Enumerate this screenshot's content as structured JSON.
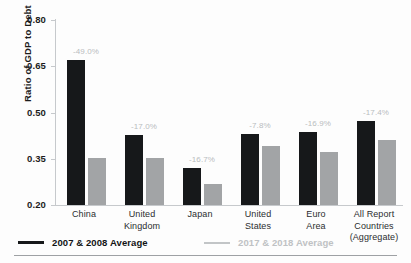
{
  "figure": {
    "top_caption": "",
    "background": "#fdfdfd"
  },
  "colors": {
    "series_old": "#16181a",
    "series_new": "#a2a4a6",
    "annotation": "#b9bcbe",
    "axis": "#c6c9cc",
    "text": "#1c1c1c"
  },
  "chart_data": {
    "type": "bar",
    "title": "",
    "xlabel": "",
    "ylabel": "Ratio of GDP to Debt",
    "ylim": [
      0.2,
      0.8
    ],
    "yticks": [
      "0.20",
      "0.35",
      "0.50",
      "0.65",
      "0.80"
    ],
    "ytick_values": [
      0.2,
      0.35,
      0.5,
      0.65,
      0.8
    ],
    "grid": false,
    "legend_position": "below-axis-left",
    "categories": [
      "China",
      "United Kingdom",
      "Japan",
      "United States",
      "Euro Area",
      "All Report Countries (Aggregate)"
    ],
    "category_lines": [
      [
        "China"
      ],
      [
        "United",
        "Kingdom"
      ],
      [
        "Japan"
      ],
      [
        "United",
        "States"
      ],
      [
        "Euro",
        "Area"
      ],
      [
        "All Report",
        "Countries",
        "(Aggregate)"
      ]
    ],
    "series": [
      {
        "name": "2007 & 2008 Average",
        "color": "#16181a",
        "values": [
          0.67,
          0.428,
          0.32,
          0.43,
          0.437,
          0.473
        ]
      },
      {
        "name": "2017 & 2018 Average",
        "color": "#a2a4a6",
        "values": [
          0.353,
          0.353,
          0.267,
          0.393,
          0.372,
          0.411
        ]
      }
    ],
    "annotations": [
      "-49.0%",
      "-17.0%",
      "-16.7%",
      "-7.8%",
      "-16.9%",
      "-17.4%"
    ]
  },
  "legend": {
    "items": [
      {
        "label": "2007 & 2008 Average",
        "style": "dark"
      },
      {
        "label": "2017 & 2018 Average",
        "style": "light"
      }
    ]
  }
}
